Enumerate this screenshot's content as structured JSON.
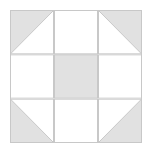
{
  "canvas": {
    "width": 151,
    "height": 153,
    "background_color": "#ffffff"
  },
  "block": {
    "name": "Shoo Fly quilt block",
    "x": 10,
    "y": 10,
    "width": 132,
    "height": 133,
    "grid_rows": 3,
    "grid_cols": 3,
    "fill_color": "#e1e1e1",
    "background_color": "#ffffff",
    "line_color": "#c8c8c8",
    "line_width": 1,
    "cells": [
      {
        "id": "cell-r0c0",
        "row": 0,
        "col": 0,
        "type": "half-square-triangle",
        "fill": "#e1e1e1",
        "ground": "#ffffff",
        "triangle_corner": "top-left"
      },
      {
        "id": "cell-r0c1",
        "row": 0,
        "col": 1,
        "type": "solid",
        "fill": "#ffffff",
        "ground": "#ffffff",
        "triangle_corner": ""
      },
      {
        "id": "cell-r0c2",
        "row": 0,
        "col": 2,
        "type": "half-square-triangle",
        "fill": "#e1e1e1",
        "ground": "#ffffff",
        "triangle_corner": "top-right"
      },
      {
        "id": "cell-r1c0",
        "row": 1,
        "col": 0,
        "type": "solid",
        "fill": "#ffffff",
        "ground": "#ffffff",
        "triangle_corner": ""
      },
      {
        "id": "cell-r1c1",
        "row": 1,
        "col": 1,
        "type": "solid",
        "fill": "#e1e1e1",
        "ground": "#ffffff",
        "triangle_corner": ""
      },
      {
        "id": "cell-r1c2",
        "row": 1,
        "col": 2,
        "type": "solid",
        "fill": "#ffffff",
        "ground": "#ffffff",
        "triangle_corner": ""
      },
      {
        "id": "cell-r2c0",
        "row": 2,
        "col": 0,
        "type": "half-square-triangle",
        "fill": "#e1e1e1",
        "ground": "#ffffff",
        "triangle_corner": "bottom-left"
      },
      {
        "id": "cell-r2c1",
        "row": 2,
        "col": 1,
        "type": "solid",
        "fill": "#ffffff",
        "ground": "#ffffff",
        "triangle_corner": ""
      },
      {
        "id": "cell-r2c2",
        "row": 2,
        "col": 2,
        "type": "half-square-triangle",
        "fill": "#e1e1e1",
        "ground": "#ffffff",
        "triangle_corner": "bottom-right"
      }
    ]
  }
}
